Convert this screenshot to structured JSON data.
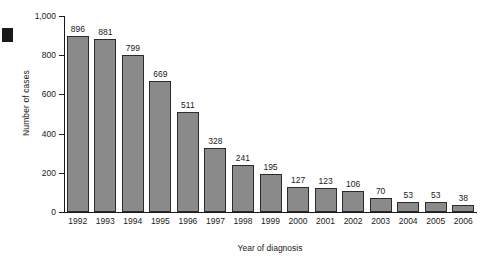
{
  "chart_data": {
    "type": "bar",
    "title": "",
    "xlabel": "Year of diagnosis",
    "ylabel": "Number of cases",
    "categories": [
      "1992",
      "1993",
      "1994",
      "1995",
      "1996",
      "1997",
      "1998",
      "1999",
      "2000",
      "2001",
      "2002",
      "2003",
      "2004",
      "2005",
      "2006"
    ],
    "values": [
      896,
      881,
      799,
      669,
      511,
      328,
      241,
      195,
      127,
      123,
      106,
      70,
      53,
      53,
      38
    ],
    "data_labels": [
      "896",
      "881",
      "799",
      "669",
      "511",
      "328",
      "241",
      "195",
      "127",
      "123",
      "106",
      "70",
      "53",
      "53",
      "38"
    ],
    "ylim": [
      0,
      1000
    ],
    "yticks": [
      0,
      200,
      400,
      600,
      800,
      1000
    ],
    "ytick_labels": [
      "0",
      "200",
      "400",
      "600",
      "800",
      "1,000"
    ],
    "grid": false,
    "legend": null,
    "bar_color": "#8a8a8a",
    "bar_border_color": "#2b2b2b",
    "axis_color": "#1a1a1a"
  }
}
